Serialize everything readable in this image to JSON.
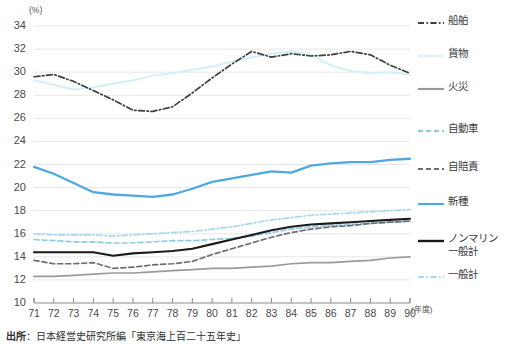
{
  "axis": {
    "y_unit": "(%)",
    "x_unit": "(年度)",
    "y_ticks": [
      "34",
      "32",
      "30",
      "28",
      "26",
      "24",
      "22",
      "20",
      "18",
      "16",
      "14",
      "12",
      "10"
    ],
    "x_ticks": [
      "71",
      "72",
      "73",
      "74",
      "75",
      "76",
      "77",
      "78",
      "79",
      "80",
      "81",
      "82",
      "83",
      "84",
      "85",
      "86",
      "87",
      "88",
      "89",
      "90"
    ]
  },
  "legend": {
    "items": [
      {
        "label": "船舶",
        "color": "#3f3f3f",
        "style": "dashdot"
      },
      {
        "label": "貨物",
        "color": "#d6eef5",
        "style": "solid"
      },
      {
        "label": "火災",
        "color": "#9a9a9a",
        "style": "solid"
      },
      {
        "label": "自動車",
        "color": "#8ecbe8",
        "style": "dashed"
      },
      {
        "label": "自賠責",
        "color": "#6e6e6e",
        "style": "dashed"
      },
      {
        "label": "新種",
        "color": "#4da9e0",
        "style": "solid"
      },
      {
        "label": "ノンマリン\n一般計",
        "color": "#1a1a1a",
        "style": "solid"
      },
      {
        "label": "一般計",
        "color": "#a8d8ef",
        "style": "dashdot"
      }
    ]
  },
  "source": {
    "prefix": "出所",
    "text": "：日本経営史研究所編「東京海上百二十五年史」"
  },
  "chart_data": {
    "type": "line",
    "title": "",
    "xlabel": "(年度)",
    "ylabel": "(%)",
    "xlim": [
      71,
      90
    ],
    "ylim": [
      10,
      34
    ],
    "grid": true,
    "legend_position": "right",
    "x": [
      71,
      72,
      73,
      74,
      75,
      76,
      77,
      78,
      79,
      80,
      81,
      82,
      83,
      84,
      85,
      86,
      87,
      88,
      89,
      90
    ],
    "series": [
      {
        "name": "船舶",
        "color": "#3f3f3f",
        "style": "dashdot",
        "values": [
          29.6,
          29.8,
          29.2,
          28.4,
          27.6,
          26.7,
          26.6,
          27.0,
          28.2,
          29.5,
          30.7,
          31.8,
          31.3,
          31.6,
          31.4,
          31.5,
          31.8,
          31.5,
          30.6,
          29.9
        ]
      },
      {
        "name": "貨物",
        "color": "#d6eef5",
        "style": "solid",
        "values": [
          29.3,
          28.9,
          28.5,
          28.7,
          29.0,
          29.3,
          29.7,
          29.9,
          30.2,
          30.5,
          30.9,
          31.3,
          31.6,
          31.8,
          31.5,
          30.6,
          30.1,
          29.9,
          30.0,
          29.8
        ]
      },
      {
        "name": "火災",
        "color": "#9a9a9a",
        "style": "solid",
        "values": [
          12.3,
          12.3,
          12.4,
          12.5,
          12.6,
          12.6,
          12.7,
          12.8,
          12.9,
          13.0,
          13.0,
          13.1,
          13.2,
          13.4,
          13.5,
          13.5,
          13.6,
          13.7,
          13.9,
          14.0
        ]
      },
      {
        "name": "自動車",
        "color": "#8ecbe8",
        "style": "dashed",
        "values": [
          15.5,
          15.4,
          15.3,
          15.3,
          15.2,
          15.2,
          15.3,
          15.4,
          15.4,
          15.5,
          15.6,
          15.8,
          16.1,
          16.4,
          16.6,
          16.7,
          16.8,
          16.9,
          17.0,
          17.1
        ]
      },
      {
        "name": "自賠責",
        "color": "#6e6e6e",
        "style": "dashed",
        "values": [
          13.7,
          13.4,
          13.4,
          13.5,
          13.0,
          13.1,
          13.3,
          13.4,
          13.6,
          14.2,
          14.7,
          15.2,
          15.7,
          16.1,
          16.4,
          16.6,
          16.7,
          16.9,
          17.0,
          17.1
        ]
      },
      {
        "name": "新種",
        "color": "#4da9e0",
        "style": "solid",
        "values": [
          21.8,
          21.2,
          20.4,
          19.6,
          19.4,
          19.3,
          19.2,
          19.4,
          19.9,
          20.5,
          20.8,
          21.1,
          21.4,
          21.3,
          21.9,
          22.1,
          22.2,
          22.2,
          22.4,
          22.5
        ]
      },
      {
        "name": "ノンマリン一般計",
        "color": "#1a1a1a",
        "style": "solid",
        "values": [
          14.4,
          14.4,
          14.4,
          14.4,
          14.1,
          14.3,
          14.4,
          14.5,
          14.7,
          15.1,
          15.5,
          15.9,
          16.3,
          16.6,
          16.8,
          16.9,
          17.0,
          17.1,
          17.2,
          17.3
        ]
      },
      {
        "name": "一般計",
        "color": "#a8d8ef",
        "style": "dashdot",
        "values": [
          16.0,
          15.9,
          15.9,
          15.9,
          15.8,
          15.9,
          16.0,
          16.1,
          16.2,
          16.4,
          16.6,
          16.9,
          17.2,
          17.4,
          17.6,
          17.7,
          17.8,
          17.9,
          18.0,
          18.1
        ]
      }
    ]
  }
}
